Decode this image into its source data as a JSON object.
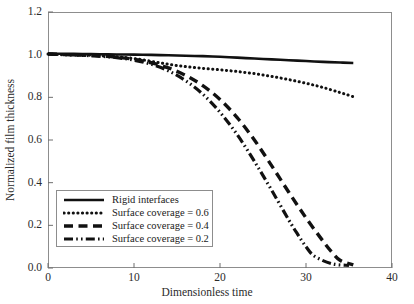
{
  "chart_data": {
    "type": "line",
    "title": "",
    "xlabel": "Dimensionless time",
    "ylabel": "Normalized film thickness",
    "xlim": [
      0,
      40
    ],
    "ylim": [
      0.0,
      1.2
    ],
    "xticks": [
      "0",
      "10",
      "20",
      "30",
      "40"
    ],
    "xtick_values": [
      0,
      10,
      20,
      30,
      40
    ],
    "yticks": [
      "0.0",
      "0.2",
      "0.4",
      "0.6",
      "0.8",
      "1.0",
      "1.2"
    ],
    "ytick_values": [
      0.0,
      0.2,
      0.4,
      0.6,
      0.8,
      1.0,
      1.2
    ],
    "grid": false,
    "legend_position": "lower-left",
    "line_color": "#111111",
    "series": [
      {
        "name": "Rigid interfaces",
        "style": "solid",
        "x": [
          0,
          2,
          4,
          6,
          8,
          10,
          12,
          14,
          16,
          18,
          20,
          22,
          24,
          26,
          28,
          30,
          32,
          34,
          35.5
        ],
        "values": [
          1.005,
          1.004,
          1.003,
          1.002,
          1.001,
          1.0,
          0.999,
          0.997,
          0.995,
          0.993,
          0.99,
          0.986,
          0.982,
          0.978,
          0.974,
          0.97,
          0.966,
          0.963,
          0.961
        ]
      },
      {
        "name": "Surface coverage = 0.6",
        "style": "dotted",
        "x": [
          0,
          2,
          4,
          6,
          8,
          10,
          12,
          14,
          16,
          18,
          20,
          22,
          24,
          26,
          28,
          30,
          32,
          34,
          35.5
        ],
        "values": [
          1.003,
          1.0,
          0.998,
          0.995,
          0.99,
          0.982,
          0.969,
          0.955,
          0.944,
          0.936,
          0.929,
          0.921,
          0.911,
          0.898,
          0.883,
          0.866,
          0.846,
          0.822,
          0.803
        ]
      },
      {
        "name": "Surface coverage = 0.4",
        "style": "dashed",
        "x": [
          0,
          2,
          4,
          6,
          8,
          10,
          12,
          14,
          16,
          18,
          20,
          22,
          24,
          26,
          28,
          30,
          32,
          33,
          34,
          35.5
        ],
        "values": [
          1.003,
          1.0,
          0.998,
          0.994,
          0.988,
          0.978,
          0.962,
          0.938,
          0.903,
          0.855,
          0.79,
          0.705,
          0.6,
          0.48,
          0.355,
          0.235,
          0.125,
          0.075,
          0.035,
          0.015
        ]
      },
      {
        "name": "Surface coverage = 0.2",
        "style": "dashdotdot",
        "x": [
          0,
          2,
          4,
          6,
          8,
          10,
          12,
          14,
          16,
          18,
          20,
          22,
          24,
          26,
          28,
          29,
          30,
          31,
          33,
          35
        ],
        "values": [
          1.003,
          1.0,
          0.997,
          0.993,
          0.986,
          0.974,
          0.955,
          0.924,
          0.878,
          0.815,
          0.73,
          0.625,
          0.5,
          0.365,
          0.225,
          0.16,
          0.1,
          0.055,
          0.02,
          0.012
        ]
      }
    ]
  },
  "legend": {
    "entries": [
      {
        "label": "Rigid interfaces"
      },
      {
        "label": "Surface coverage = 0.6"
      },
      {
        "label": "Surface coverage = 0.4"
      },
      {
        "label": "Surface coverage = 0.2"
      }
    ]
  }
}
